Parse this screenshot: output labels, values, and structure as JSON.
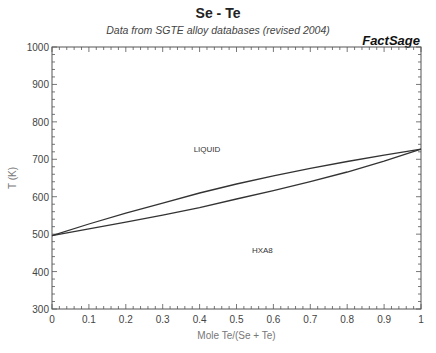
{
  "chart_data": {
    "type": "line",
    "title": "Se - Te",
    "subtitle": "Data from SGTE alloy databases (revised 2004)",
    "brand": "FactSage",
    "xlabel": "Mole Te/(Se + Te)",
    "ylabel": "T (K)",
    "xlim": [
      0,
      1
    ],
    "ylim": [
      300,
      1000
    ],
    "xticks": [
      "0",
      "0.1",
      "0.2",
      "0.3",
      "0.4",
      "0.5",
      "0.6",
      "0.7",
      "0.8",
      "0.9",
      "1"
    ],
    "yticks": [
      "300",
      "400",
      "500",
      "600",
      "700",
      "800",
      "900",
      "1000"
    ],
    "grid": false,
    "legend": null,
    "series": [
      {
        "name": "liquidus",
        "x": [
          0,
          0.1,
          0.2,
          0.3,
          0.4,
          0.5,
          0.6,
          0.7,
          0.8,
          0.9,
          1.0
        ],
        "y": [
          496,
          527,
          556,
          583,
          610,
          634,
          656,
          676,
          694,
          711,
          727
        ]
      },
      {
        "name": "solidus",
        "x": [
          0,
          0.1,
          0.2,
          0.3,
          0.4,
          0.5,
          0.6,
          0.7,
          0.8,
          0.9,
          1.0
        ],
        "y": [
          496,
          514,
          532,
          551,
          571,
          594,
          616,
          640,
          666,
          695,
          727
        ]
      }
    ],
    "annotations": [
      {
        "text": "LIQUID",
        "x": 0.42,
        "y": 728
      },
      {
        "text": "HXA8",
        "x": 0.57,
        "y": 458
      }
    ]
  }
}
